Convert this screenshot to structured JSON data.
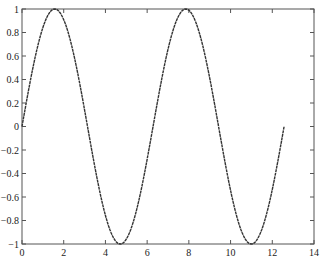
{
  "chart_data": {
    "type": "line",
    "title": "",
    "xlabel": "",
    "ylabel": "",
    "function": "y = sin(x)",
    "x_range": [
      0,
      12.566
    ],
    "xlim": [
      0,
      14
    ],
    "ylim": [
      -1,
      1
    ],
    "grid": false,
    "legend": null,
    "x_ticks": [
      0,
      2,
      4,
      6,
      8,
      10,
      12,
      14
    ],
    "x_tick_labels": [
      "0",
      "2",
      "4",
      "6",
      "8",
      "10",
      "12",
      "14"
    ],
    "y_ticks": [
      -1,
      -0.8,
      -0.6,
      -0.4,
      -0.2,
      0,
      0.2,
      0.4,
      0.6,
      0.8,
      1
    ],
    "y_tick_labels": [
      "-1",
      "-0.8",
      "-0.6",
      "-0.4",
      "-0.2",
      "0",
      "0.2",
      "0.4",
      "0.6",
      "0.8",
      "1"
    ],
    "series": [
      {
        "name": "sin(x)",
        "color": "#333333",
        "samples": 200,
        "x_start": 0,
        "x_end": 12.566
      }
    ],
    "key_points": [
      {
        "x": 0,
        "y": 0
      },
      {
        "x": 1.571,
        "y": 1
      },
      {
        "x": 3.142,
        "y": 0
      },
      {
        "x": 4.712,
        "y": -1
      },
      {
        "x": 6.283,
        "y": 0
      },
      {
        "x": 7.854,
        "y": 1
      },
      {
        "x": 9.425,
        "y": 0
      },
      {
        "x": 10.996,
        "y": -1
      },
      {
        "x": 12.566,
        "y": 0
      }
    ]
  },
  "layout": {
    "plot_left": 22,
    "plot_right": 314,
    "plot_top": 9,
    "plot_bottom": 244
  }
}
